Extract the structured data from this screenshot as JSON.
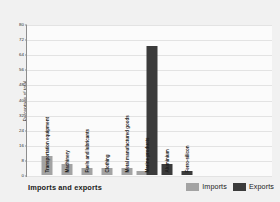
{
  "chart_data": {
    "type": "bar",
    "title": "",
    "xlabel": "Imports and exports",
    "ylabel": "Percentage of total",
    "ylim": [
      0,
      80
    ],
    "ytick_step": 8,
    "yticks": [
      0,
      8,
      16,
      24,
      32,
      40,
      48,
      56,
      64,
      72,
      80
    ],
    "grid": true,
    "legend_position": "bottom-right",
    "categories": [
      "Transportation equipment",
      "Machinery",
      "Fuels and lubricants",
      "Clothing",
      "Metal manufactured goods",
      "Marine products",
      "Aluminium",
      "Ferro-silicon"
    ],
    "series": [
      {
        "name": "Imports",
        "color": "#a3a3a3",
        "values": [
          10,
          6,
          4,
          4,
          4,
          2,
          null,
          null
        ]
      },
      {
        "name": "Exports",
        "color": "#3b3b3b",
        "values": [
          null,
          null,
          null,
          null,
          null,
          69,
          6,
          2
        ]
      }
    ],
    "bars": [
      {
        "category": "Transportation equipment",
        "series": "Imports",
        "value": 10
      },
      {
        "category": "Machinery",
        "series": "Imports",
        "value": 6
      },
      {
        "category": "Fuels and lubricants",
        "series": "Imports",
        "value": 4
      },
      {
        "category": "Clothing",
        "series": "Imports",
        "value": 4
      },
      {
        "category": "Metal manufactured goods",
        "series": "Imports",
        "value": 4
      },
      {
        "category": "Marine products",
        "series": "Imports",
        "value": 2
      },
      {
        "category": "Marine products",
        "series": "Exports",
        "value": 69
      },
      {
        "category": "Aluminium",
        "series": "Exports",
        "value": 6
      },
      {
        "category": "Ferro-silicon",
        "series": "Exports",
        "value": 2
      }
    ]
  },
  "legend": {
    "imports_label": "Imports",
    "exports_label": "Exports"
  },
  "colors": {
    "imports": "#a3a3a3",
    "exports": "#3b3b3b",
    "background": "#f1f1f1",
    "plot_background": "#fbfbfb",
    "gridline": "#e3e3e3",
    "axis": "#8d8d8d"
  }
}
